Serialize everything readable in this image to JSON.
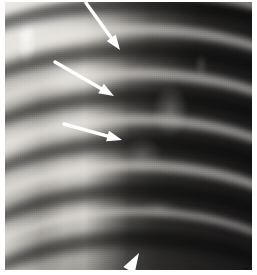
{
  "figure": {
    "type": "radiograph",
    "modality": "chest x-ray",
    "view": "close-up of right upper hemithorax",
    "caption": "",
    "width": 257,
    "height": 275
  },
  "plate": {
    "background_color": "#0b0b0b",
    "soft_tissue_color": "#e9e7e2",
    "lung_field_color": "#1a1919",
    "rib_color": "#eceae5"
  },
  "annotations": {
    "marker_color": "#ffffff",
    "items": [
      {
        "name": "arrow-1",
        "shape": "arrow",
        "label": "",
        "x1": 86,
        "y1": 3,
        "x2": 120,
        "y2": 50,
        "shaft_width": 3.4,
        "head_length": 15,
        "head_width": 11
      },
      {
        "name": "arrow-2",
        "shape": "arrow",
        "label": "",
        "x1": 55,
        "y1": 62,
        "x2": 114,
        "y2": 96,
        "shaft_width": 3.4,
        "head_length": 15,
        "head_width": 11
      },
      {
        "name": "arrow-3",
        "shape": "arrow",
        "label": "",
        "x1": 64,
        "y1": 124,
        "x2": 122,
        "y2": 140,
        "shaft_width": 3.4,
        "head_length": 15,
        "head_width": 11
      },
      {
        "name": "arrowhead-4",
        "shape": "arrowhead",
        "label": "",
        "x1": 128,
        "y1": 272,
        "x2": 139,
        "y2": 253,
        "head_length": 20,
        "head_width": 13
      }
    ]
  },
  "anatomy": {
    "ribs": [
      {
        "name": "rib-1",
        "top": -58,
        "height": 168,
        "weight": "thin"
      },
      {
        "name": "rib-2",
        "top": -18,
        "height": 196,
        "weight": "bold"
      },
      {
        "name": "rib-3",
        "top": 22,
        "height": 214,
        "weight": "bold"
      },
      {
        "name": "rib-4",
        "top": 66,
        "height": 228,
        "weight": "bold"
      },
      {
        "name": "rib-5",
        "top": 112,
        "height": 240,
        "weight": "bold"
      },
      {
        "name": "rib-6",
        "top": 158,
        "height": 250,
        "weight": "bold"
      },
      {
        "name": "rib-7",
        "top": 206,
        "height": 258,
        "weight": "thin"
      }
    ],
    "intercostal_spaces": [
      {
        "name": "space-1",
        "top": -6,
        "height": 188
      },
      {
        "name": "space-2",
        "top": 40,
        "height": 212
      },
      {
        "name": "space-3",
        "top": 86,
        "height": 228
      },
      {
        "name": "space-4",
        "top": 132,
        "height": 242
      },
      {
        "name": "space-5",
        "top": 180,
        "height": 252
      },
      {
        "name": "space-6",
        "top": 228,
        "height": 260
      }
    ]
  }
}
